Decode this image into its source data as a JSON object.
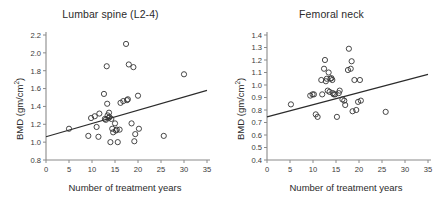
{
  "figure": {
    "panel_count": 2,
    "background_color": "#ffffff",
    "marker_color": "#333333",
    "line_color": "#2b2b2b",
    "axis_color": "#8a8a8a"
  },
  "panels": [
    {
      "title": "Lumbar spine (L2-4)",
      "xlabel": "Number of treatment years",
      "ylabel_text": "BMD (gm/cm",
      "ylabel_sup": "2",
      "ylabel_tail": ")"
    },
    {
      "title": "Femoral neck",
      "xlabel": "Number of treatment years",
      "ylabel_text": "BMD (gm/cm",
      "ylabel_sup": "2",
      "ylabel_tail": ")"
    }
  ],
  "chart_data": [
    {
      "type": "scatter",
      "title": "Lumbar spine (L2-4)",
      "xlabel": "Number of treatment years",
      "ylabel": "BMD (gm/cm2)",
      "xlim": [
        0,
        35
      ],
      "ylim": [
        0.8,
        2.2
      ],
      "xticks": [
        0,
        5,
        10,
        15,
        20,
        25,
        30,
        35
      ],
      "yticks": [
        0.8,
        1.0,
        1.2,
        1.4,
        1.6,
        1.8,
        2.0,
        2.2
      ],
      "ytick_labels": [
        "0.8",
        "1.0",
        "1.2",
        "1.4",
        "1.6",
        "1.8",
        "2.0",
        "2.2"
      ],
      "xtick_labels": [
        "0",
        "5",
        "10",
        "15",
        "20",
        "25",
        "30",
        "35"
      ],
      "grid": false,
      "legend": null,
      "marker_style": "open-circle",
      "points": [
        [
          5.0,
          1.15
        ],
        [
          9.2,
          1.07
        ],
        [
          9.8,
          1.27
        ],
        [
          10.6,
          1.29
        ],
        [
          11.0,
          1.17
        ],
        [
          11.4,
          1.06
        ],
        [
          11.6,
          1.32
        ],
        [
          12.6,
          1.54
        ],
        [
          12.8,
          1.26
        ],
        [
          13.0,
          1.25
        ],
        [
          13.2,
          1.85
        ],
        [
          13.3,
          1.43
        ],
        [
          13.4,
          1.3
        ],
        [
          13.6,
          1.27
        ],
        [
          13.7,
          1.33
        ],
        [
          13.8,
          1.28
        ],
        [
          14.0,
          1.0
        ],
        [
          14.2,
          1.26
        ],
        [
          14.4,
          1.15
        ],
        [
          14.6,
          1.11
        ],
        [
          15.0,
          1.21
        ],
        [
          15.2,
          1.13
        ],
        [
          15.4,
          1.14
        ],
        [
          15.6,
          1.0
        ],
        [
          16.0,
          1.14
        ],
        [
          16.2,
          1.44
        ],
        [
          16.8,
          1.46
        ],
        [
          17.4,
          2.1
        ],
        [
          17.6,
          1.47
        ],
        [
          17.8,
          1.48
        ],
        [
          18.0,
          1.87
        ],
        [
          18.6,
          1.21
        ],
        [
          19.0,
          1.84
        ],
        [
          19.2,
          1.01
        ],
        [
          19.4,
          1.09
        ],
        [
          20.0,
          1.52
        ],
        [
          20.2,
          1.15
        ],
        [
          25.6,
          1.07
        ],
        [
          30.0,
          1.76
        ]
      ],
      "regression_line": {
        "x": [
          0,
          35
        ],
        "y": [
          1.06,
          1.58
        ],
        "style": "solid"
      }
    },
    {
      "type": "scatter",
      "title": "Femoral neck",
      "xlabel": "Number of treatment years",
      "ylabel": "BMD (gm/cm2)",
      "xlim": [
        0,
        35
      ],
      "ylim": [
        0.4,
        1.4
      ],
      "xticks": [
        0,
        5,
        10,
        15,
        20,
        25,
        30,
        35
      ],
      "yticks": [
        0.4,
        0.5,
        0.6,
        0.7,
        0.8,
        0.9,
        1.0,
        1.1,
        1.2,
        1.3,
        1.4
      ],
      "ytick_labels": [
        "0.4",
        "0.5",
        "0.6",
        "0.7",
        "0.8",
        "0.9",
        "1.0",
        "1.1",
        "1.2",
        "1.3",
        "1.4"
      ],
      "xtick_labels": [
        "0",
        "5",
        "10",
        "15",
        "20",
        "25",
        "30",
        "35"
      ],
      "grid": false,
      "legend": null,
      "marker_style": "open-circle",
      "points": [
        [
          5.2,
          0.845
        ],
        [
          9.4,
          0.915
        ],
        [
          9.9,
          0.925
        ],
        [
          10.2,
          0.925
        ],
        [
          10.6,
          0.765
        ],
        [
          11.0,
          0.745
        ],
        [
          11.8,
          1.04
        ],
        [
          12.0,
          0.925
        ],
        [
          12.4,
          1.13
        ],
        [
          12.6,
          1.2
        ],
        [
          12.8,
          1.03
        ],
        [
          13.0,
          1.05
        ],
        [
          13.2,
          0.955
        ],
        [
          13.4,
          1.1
        ],
        [
          13.6,
          0.945
        ],
        [
          13.8,
          1.05
        ],
        [
          14.0,
          1.055
        ],
        [
          14.2,
          1.04
        ],
        [
          14.3,
          0.935
        ],
        [
          14.5,
          0.925
        ],
        [
          14.8,
          0.925
        ],
        [
          15.2,
          0.745
        ],
        [
          15.6,
          0.935
        ],
        [
          15.8,
          0.955
        ],
        [
          16.4,
          0.885
        ],
        [
          16.8,
          0.875
        ],
        [
          17.0,
          0.84
        ],
        [
          17.6,
          1.12
        ],
        [
          17.8,
          1.29
        ],
        [
          18.2,
          1.13
        ],
        [
          18.4,
          1.19
        ],
        [
          18.6,
          0.79
        ],
        [
          19.0,
          1.04
        ],
        [
          19.4,
          0.8
        ],
        [
          19.8,
          0.865
        ],
        [
          20.2,
          1.04
        ],
        [
          20.4,
          0.875
        ],
        [
          25.8,
          0.785
        ]
      ],
      "regression_line": {
        "x": [
          0,
          35
        ],
        "y": [
          0.745,
          1.085
        ],
        "style": "solid"
      }
    }
  ]
}
